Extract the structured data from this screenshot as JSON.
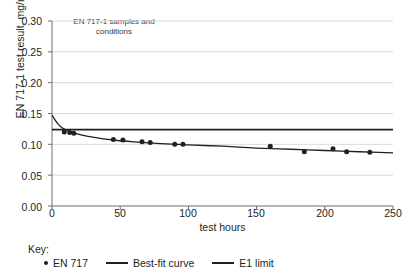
{
  "chart_data": {
    "type": "scatter",
    "title": "",
    "xlabel": "test hours",
    "ylabel": "EN 717-1 test result, mg/m³",
    "xlim": [
      0,
      250
    ],
    "ylim": [
      0.0,
      0.3
    ],
    "xticks": [
      "0",
      "50",
      "100",
      "150",
      "200",
      "250"
    ],
    "xtick_values": [
      0,
      50,
      100,
      150,
      200,
      250
    ],
    "yticks": [
      "0.00",
      "0.05",
      "0.10",
      "0.15",
      "0.20",
      "0.25",
      "0.30"
    ],
    "ytick_values": [
      0.0,
      0.05,
      0.1,
      0.15,
      0.2,
      0.25,
      0.3
    ],
    "grid": true,
    "grid_axis": "y",
    "legend_position": "below-plot",
    "annotation": {
      "line1": "EN 717-1 samples and",
      "line2": "conditions"
    },
    "series": [
      {
        "name": "EN 717",
        "type": "scatter",
        "marker": "circle",
        "color": "#231f20",
        "points": [
          {
            "x": 9,
            "y": 0.12
          },
          {
            "x": 13,
            "y": 0.119
          },
          {
            "x": 16,
            "y": 0.118
          },
          {
            "x": 45,
            "y": 0.108
          },
          {
            "x": 52,
            "y": 0.107
          },
          {
            "x": 66,
            "y": 0.104
          },
          {
            "x": 72,
            "y": 0.103
          },
          {
            "x": 90,
            "y": 0.1
          },
          {
            "x": 96,
            "y": 0.1
          },
          {
            "x": 160,
            "y": 0.097
          },
          {
            "x": 185,
            "y": 0.088
          },
          {
            "x": 206,
            "y": 0.093
          },
          {
            "x": 216,
            "y": 0.088
          },
          {
            "x": 233,
            "y": 0.087
          }
        ]
      },
      {
        "name": "Best-fit curve",
        "type": "line",
        "color": "#231f20",
        "points": [
          {
            "x": 0,
            "y": 0.147
          },
          {
            "x": 4,
            "y": 0.134
          },
          {
            "x": 8,
            "y": 0.126
          },
          {
            "x": 14,
            "y": 0.12
          },
          {
            "x": 22,
            "y": 0.115
          },
          {
            "x": 32,
            "y": 0.111
          },
          {
            "x": 45,
            "y": 0.107
          },
          {
            "x": 60,
            "y": 0.104
          },
          {
            "x": 80,
            "y": 0.101
          },
          {
            "x": 100,
            "y": 0.099
          },
          {
            "x": 125,
            "y": 0.097
          },
          {
            "x": 150,
            "y": 0.094
          },
          {
            "x": 175,
            "y": 0.092
          },
          {
            "x": 200,
            "y": 0.09
          },
          {
            "x": 225,
            "y": 0.088
          },
          {
            "x": 250,
            "y": 0.086
          }
        ]
      },
      {
        "name": "E1 limit",
        "type": "hline",
        "color": "#231f20",
        "value": 0.124
      }
    ]
  },
  "legend": {
    "key_label": "Key:",
    "items": [
      {
        "label": "EN 717",
        "marker": "dot"
      },
      {
        "label": "Best-fit curve",
        "marker": "line"
      },
      {
        "label": "E1 limit",
        "marker": "line"
      }
    ]
  }
}
